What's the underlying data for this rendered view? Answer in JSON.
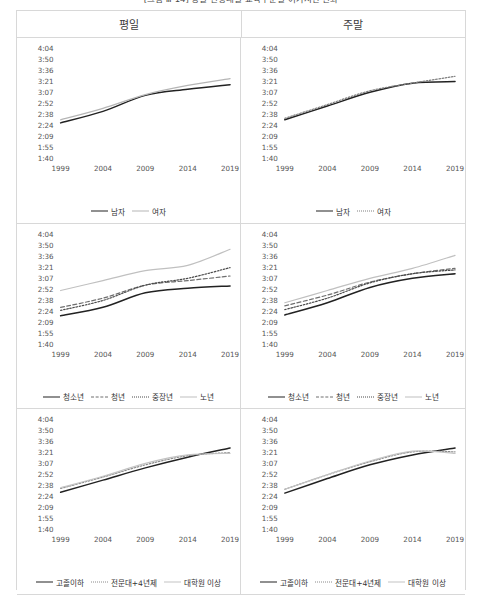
{
  "figure": {
    "title": "[그림 Ⅲ-14] 성별·연령대별·교육수준별 여가시간 변화",
    "columns": [
      "평일",
      "주말"
    ]
  },
  "axis": {
    "yticks": [
      "4:04",
      "3:50",
      "3:36",
      "3:21",
      "3:07",
      "2:52",
      "2:38",
      "2:24",
      "2:09",
      "1:55",
      "1:40"
    ],
    "xticks": [
      "1999",
      "2004",
      "2009",
      "2014",
      "2019"
    ],
    "ymin_minutes": 100,
    "ymax_minutes": 244
  },
  "chart_data": [
    {
      "type": "line",
      "title": "평일 · 성별",
      "panel": "top-left",
      "xlabel": "",
      "ylabel": "",
      "x": [
        1999,
        2004,
        2009,
        2014,
        2019
      ],
      "xticklabels": [
        "1999",
        "2004",
        "2009",
        "2014",
        "2019"
      ],
      "yticklabels": [
        "4:04",
        "3:50",
        "3:36",
        "3:21",
        "3:07",
        "2:52",
        "2:38",
        "2:24",
        "2:09",
        "1:55",
        "1:40"
      ],
      "ylim": [
        100,
        244
      ],
      "grid": false,
      "legend_position": "bottom",
      "series": [
        {
          "name": "남자",
          "style": "solid",
          "color": "#222222",
          "values": [
            146,
            161,
            182,
            190,
            196
          ]
        },
        {
          "name": "여자",
          "style": "solid",
          "color": "#b5b5b5",
          "values": [
            150,
            165,
            183,
            195,
            204
          ]
        }
      ]
    },
    {
      "type": "line",
      "title": "주말 · 성별",
      "panel": "top-right",
      "xlabel": "",
      "ylabel": "",
      "x": [
        1999,
        2004,
        2009,
        2014,
        2019
      ],
      "xticklabels": [
        "1999",
        "2004",
        "2009",
        "2014",
        "2019"
      ],
      "yticklabels": [
        "4:04",
        "3:50",
        "3:36",
        "3:21",
        "3:07",
        "2:52",
        "2:38",
        "2:24",
        "2:09",
        "1:55",
        "1:40"
      ],
      "ylim": [
        100,
        244
      ],
      "grid": false,
      "legend_position": "bottom",
      "series": [
        {
          "name": "남자",
          "style": "solid",
          "color": "#222222",
          "values": [
            150,
            168,
            186,
            198,
            200
          ]
        },
        {
          "name": "여자",
          "style": "dotted",
          "color": "#808080",
          "values": [
            152,
            170,
            188,
            198,
            207
          ]
        }
      ]
    },
    {
      "type": "line",
      "title": "평일 · 연령대별",
      "panel": "mid-left",
      "xlabel": "",
      "ylabel": "",
      "x": [
        1999,
        2004,
        2009,
        2014,
        2019
      ],
      "xticklabels": [
        "1999",
        "2004",
        "2009",
        "2014",
        "2019"
      ],
      "yticklabels": [
        "4:04",
        "3:50",
        "3:36",
        "3:21",
        "3:07",
        "2:52",
        "2:38",
        "2:24",
        "2:09",
        "1:55",
        "1:40"
      ],
      "ylim": [
        100,
        244
      ],
      "grid": false,
      "legend_position": "bottom",
      "series": [
        {
          "name": "청소년",
          "style": "solid",
          "color": "#222222",
          "values": [
            137,
            148,
            167,
            173,
            176
          ]
        },
        {
          "name": "청년",
          "style": "dashed",
          "color": "#6e6e6e",
          "values": [
            148,
            160,
            177,
            183,
            189
          ]
        },
        {
          "name": "중장년",
          "style": "dotted",
          "color": "#4a4a4a",
          "values": [
            144,
            157,
            177,
            186,
            200
          ]
        },
        {
          "name": "노년",
          "style": "solid",
          "color": "#c0c0c0",
          "values": [
            170,
            183,
            196,
            203,
            224
          ]
        }
      ]
    },
    {
      "type": "line",
      "title": "주말 · 연령대별",
      "panel": "mid-right",
      "xlabel": "",
      "ylabel": "",
      "x": [
        1999,
        2004,
        2009,
        2014,
        2019
      ],
      "xticklabels": [
        "1999",
        "2004",
        "2009",
        "2014",
        "2019"
      ],
      "yticklabels": [
        "4:04",
        "3:50",
        "3:36",
        "3:21",
        "3:07",
        "2:52",
        "2:38",
        "2:24",
        "2:09",
        "1:55",
        "1:40"
      ],
      "ylim": [
        100,
        244
      ],
      "grid": false,
      "legend_position": "bottom",
      "series": [
        {
          "name": "청소년",
          "style": "solid",
          "color": "#222222",
          "values": [
            138,
            154,
            174,
            186,
            192
          ]
        },
        {
          "name": "청년",
          "style": "dashed",
          "color": "#6e6e6e",
          "values": [
            150,
            164,
            181,
            192,
            199
          ]
        },
        {
          "name": "중장년",
          "style": "dotted",
          "color": "#4a4a4a",
          "values": [
            145,
            160,
            180,
            192,
            197
          ]
        },
        {
          "name": "노년",
          "style": "solid",
          "color": "#c0c0c0",
          "values": [
            154,
            170,
            186,
            199,
            216
          ]
        }
      ]
    },
    {
      "type": "line",
      "title": "평일 · 교육수준별",
      "panel": "bottom-left",
      "xlabel": "",
      "ylabel": "",
      "x": [
        1999,
        2004,
        2009,
        2014,
        2019
      ],
      "xticklabels": [
        "1999",
        "2004",
        "2009",
        "2014",
        "2019"
      ],
      "yticklabels": [
        "4:04",
        "3:50",
        "3:36",
        "3:21",
        "3:07",
        "2:52",
        "2:38",
        "2:24",
        "2:09",
        "1:55",
        "1:40"
      ],
      "ylim": [
        100,
        244
      ],
      "grid": false,
      "legend_position": "bottom",
      "series": [
        {
          "name": "고졸이하",
          "style": "solid",
          "color": "#222222",
          "values": [
            148,
            164,
            180,
            194,
            206
          ]
        },
        {
          "name": "전문대+4년제",
          "style": "dotted",
          "color": "#8a8a8a",
          "values": [
            153,
            168,
            184,
            196,
            200
          ]
        },
        {
          "name": "대학원 이상",
          "style": "solid",
          "color": "#c4c4c4",
          "values": [
            154,
            169,
            186,
            197,
            199
          ]
        }
      ]
    },
    {
      "type": "line",
      "title": "주말 · 교육수준별",
      "panel": "bottom-right",
      "xlabel": "",
      "ylabel": "",
      "x": [
        1999,
        2004,
        2009,
        2014,
        2019
      ],
      "xticklabels": [
        "1999",
        "2004",
        "2009",
        "2014",
        "2019"
      ],
      "yticklabels": [
        "4:04",
        "3:50",
        "3:36",
        "3:21",
        "3:07",
        "2:52",
        "2:38",
        "2:24",
        "2:09",
        "1:55",
        "1:40"
      ],
      "ylim": [
        100,
        244
      ],
      "grid": false,
      "legend_position": "bottom",
      "series": [
        {
          "name": "고졸이하",
          "style": "solid",
          "color": "#222222",
          "values": [
            147,
            166,
            184,
            197,
            206
          ]
        },
        {
          "name": "전문대+4년제",
          "style": "dotted",
          "color": "#8a8a8a",
          "values": [
            152,
            171,
            188,
            201,
            201
          ]
        },
        {
          "name": "대학원 이상",
          "style": "solid",
          "color": "#c4c4c4",
          "values": [
            152,
            171,
            189,
            202,
            199
          ]
        }
      ]
    }
  ]
}
